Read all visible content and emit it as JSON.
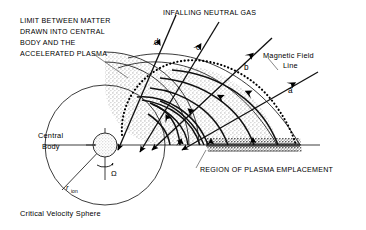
{
  "figure": {
    "caption": "Critical Velocity Sphere",
    "background_color": "#ffffff",
    "ink_color": "#000000",
    "stipple_color": "#b9b9b9",
    "dense_stipple_color": "#6e6e6e"
  },
  "labels": {
    "limit_text": {
      "lines": [
        "LIMIT BETWEEN MATTER",
        "DRAWN INTO CENTRAL",
        "BODY AND THE",
        "ACCELERATED PLASMA"
      ]
    },
    "infalling": "INFALLING NEUTRAL GAS",
    "magnetic_field_line": {
      "line1": "Magnetic  Field",
      "line2": "Line"
    },
    "region_plasma": "REGION OF PLASMA EMPLACEMENT",
    "central_body": {
      "line1": "Central",
      "line2": "Body"
    },
    "r_ion": {
      "base": "r",
      "subscript": "ion"
    },
    "omega": "Ω",
    "caption": "Critical  Velocity  Sphere"
  },
  "trajectories": [
    {
      "id": "d",
      "label": "d"
    },
    {
      "id": "c",
      "label": "c"
    },
    {
      "id": "b",
      "label": "b"
    },
    {
      "id": "a",
      "label": "a"
    }
  ],
  "icons": {
    "arrowhead": "arrowhead-icon",
    "rotation_arrow": "rotation-arrow-icon",
    "leader_line": "leader-line-icon"
  },
  "geometry": {
    "central_body_center": [
      105,
      145
    ],
    "central_body_radius": 12,
    "critical_velocity_sphere_radius": 60,
    "equator_y": 145
  }
}
